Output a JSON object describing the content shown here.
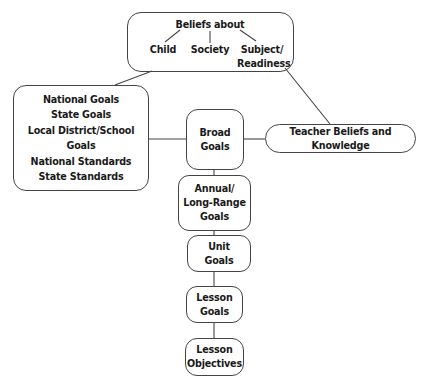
{
  "diagram": {
    "type": "hierarchy",
    "beliefs": {
      "title": "Beliefs about",
      "items": [
        "Child",
        "Society",
        "Subject/",
        "Readiness"
      ]
    },
    "external_sources": {
      "lines": [
        "National Goals",
        "State Goals",
        "Local District/School Goals",
        "National Standards",
        "State Standards"
      ]
    },
    "teacher": {
      "label": "Teacher Beliefs and Knowledge"
    },
    "chain": [
      {
        "line1": "Broad",
        "line2": "Goals",
        "line3": ""
      },
      {
        "line1": "Annual/",
        "line2": "Long-Range",
        "line3": "Goals"
      },
      {
        "line1": "Unit",
        "line2": "Goals",
        "line3": ""
      },
      {
        "line1": "Lesson",
        "line2": "Goals",
        "line3": ""
      },
      {
        "line1": "Lesson",
        "line2": "Objectives",
        "line3": ""
      }
    ],
    "colors": {
      "line": "#444444",
      "text": "#1a1a1a",
      "background": "#ffffff"
    }
  }
}
